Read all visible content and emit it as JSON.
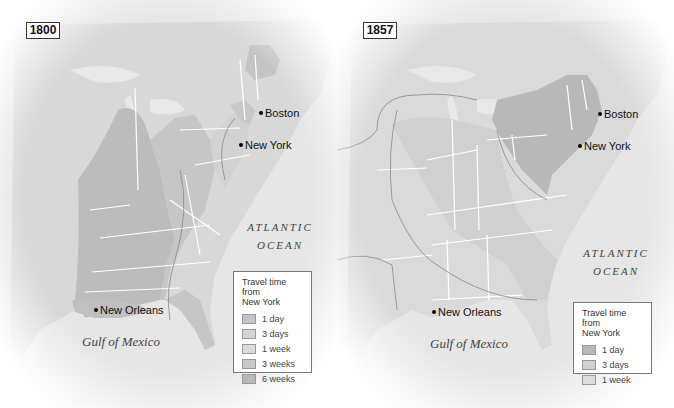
{
  "maps": [
    {
      "year": "1800",
      "cities": {
        "boston": "Boston",
        "new_york": "New York",
        "new_orleans": "New Orleans"
      },
      "ocean_line1": "ATLANTIC",
      "ocean_line2": "OCEAN",
      "gulf": "Gulf of Mexico",
      "legend": {
        "title_line1": "Travel time from",
        "title_line2": "New York",
        "items": [
          {
            "label": "1 day",
            "color": "#c4c4c4"
          },
          {
            "label": "3 days",
            "color": "#d4d4d4"
          },
          {
            "label": "1 week",
            "color": "#dcdcdc"
          },
          {
            "label": "3 weeks",
            "color": "#c8c8c8"
          },
          {
            "label": "6 weeks",
            "color": "#b8b8b8"
          }
        ]
      }
    },
    {
      "year": "1857",
      "cities": {
        "boston": "Boston",
        "new_york": "New York",
        "new_orleans": "New Orleans"
      },
      "ocean_line1": "ATLANTIC",
      "ocean_line2": "OCEAN",
      "gulf": "Gulf of Mexico",
      "legend": {
        "title_line1": "Travel time from",
        "title_line2": "New York",
        "items": [
          {
            "label": "1 day",
            "color": "#b8b8b8"
          },
          {
            "label": "3 days",
            "color": "#d0d0d0"
          },
          {
            "label": "1 week",
            "color": "#dcdcdc"
          }
        ]
      }
    }
  ],
  "colors": {
    "land": "#d6d6d6",
    "water": "#ebebeb",
    "border": "#ffffff"
  }
}
